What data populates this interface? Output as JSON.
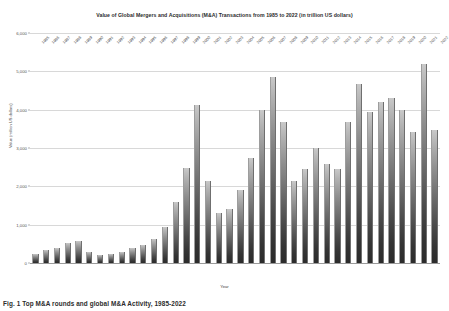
{
  "figure": {
    "caption": "Fig. 1 Top M&A rounds and global M&A Activity, 1985-2022"
  },
  "chart_data": {
    "type": "bar",
    "title": "Value of Global Mergers and Acquisitions (M&A) Transactions from 1985 to 2022 (in trillion US dollars)",
    "xlabel": "Year",
    "ylabel": "Value (million US dollars)",
    "ylim": [
      0,
      6000
    ],
    "grid": true,
    "legend": "none",
    "yticks": [
      "0",
      "1,000",
      "2,000",
      "3,000",
      "4,000",
      "5,000",
      "6,000"
    ],
    "ytick_values": [
      0,
      1000,
      2000,
      3000,
      4000,
      5000,
      6000
    ],
    "categories": [
      "1985",
      "1986",
      "1987",
      "1988",
      "1989",
      "1990",
      "1991",
      "1992",
      "1993",
      "1994",
      "1995",
      "1996",
      "1997",
      "1998",
      "1999",
      "2000",
      "2001",
      "2002",
      "2003",
      "2004",
      "2005",
      "2006",
      "2007",
      "2008",
      "2009",
      "2010",
      "2011",
      "2012",
      "2013",
      "2014",
      "2015",
      "2016",
      "2017",
      "2018",
      "2019",
      "2020",
      "2021",
      "2022"
    ],
    "values": [
      240,
      350,
      380,
      530,
      570,
      300,
      215,
      230,
      280,
      380,
      480,
      620,
      930,
      1580,
      2470,
      4120,
      2150,
      1300,
      1400,
      1900,
      2740,
      4000,
      4850,
      3670,
      2150,
      2450,
      3000,
      2590,
      2450,
      3670,
      4660,
      3950,
      4190,
      4300,
      4000,
      3430,
      5200,
      3460
    ],
    "value_unit": "million US dollars",
    "bar_count": 38,
    "bar_fill": "#6a6a6a",
    "gridline_color": "#d8d8d8"
  }
}
